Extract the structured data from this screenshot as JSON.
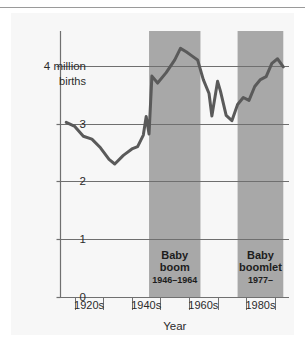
{
  "figure": {
    "background_color": "#f7f7f7",
    "page_color": "#ffffff",
    "top_rule_color": "#9a9a9a"
  },
  "chart_data": {
    "type": "line",
    "title": "",
    "subtitle": "",
    "xlabel": "Year",
    "ylabel": "4 million births",
    "ylim": [
      0,
      4.6
    ],
    "yticks": [
      0,
      1,
      2,
      3,
      4
    ],
    "ytick_labels": [
      "0",
      "1",
      "2",
      "3",
      "4 million"
    ],
    "ytick_label_extra": "births",
    "xlim": [
      1915,
      1995
    ],
    "xtick_labels": [
      "1920s",
      "1940s",
      "1960s",
      "1980s"
    ],
    "xtick_positions": [
      1925,
      1945,
      1965,
      1985
    ],
    "grid": true,
    "grid_color": "#6f6f6f",
    "legend": "none",
    "line_color": "#5a5a5a",
    "line_width": 3,
    "band_color": "#a8a8a8",
    "axis_color": "#707070",
    "series": [
      {
        "name": "Births per year (millions)",
        "x": [
          1917,
          1920,
          1923,
          1926,
          1929,
          1932,
          1934,
          1937,
          1940,
          1942,
          1944,
          1945,
          1946,
          1947,
          1949,
          1952,
          1955,
          1957,
          1959,
          1961,
          1963,
          1965,
          1967,
          1968,
          1970,
          1971,
          1973,
          1975,
          1977,
          1979,
          1981,
          1983,
          1985,
          1987,
          1989,
          1991,
          1993
        ],
        "values": [
          3.02,
          2.95,
          2.78,
          2.73,
          2.58,
          2.38,
          2.3,
          2.45,
          2.56,
          2.6,
          2.8,
          3.12,
          2.82,
          3.82,
          3.7,
          3.88,
          4.1,
          4.3,
          4.24,
          4.17,
          4.1,
          3.76,
          3.52,
          3.13,
          3.73,
          3.56,
          3.14,
          3.05,
          3.33,
          3.45,
          3.4,
          3.64,
          3.76,
          3.81,
          4.04,
          4.12,
          3.98
        ]
      }
    ],
    "annotations": [
      {
        "name": "baby-boom-band",
        "lines": [
          "Baby",
          "boom",
          "1946–1964"
        ],
        "x_start": 1946,
        "x_end": 1964,
        "fill": "#a8a8a8"
      },
      {
        "name": "baby-boomlet-band",
        "lines": [
          "Baby",
          "boomlet",
          "1977–"
        ],
        "x_start": 1977,
        "x_end": 1993,
        "fill": "#a8a8a8"
      }
    ]
  }
}
